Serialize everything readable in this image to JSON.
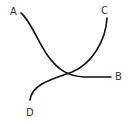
{
  "diagram": {
    "labels": {
      "a": "A",
      "b": "B",
      "c": "C",
      "d": "D"
    },
    "curves": [
      {
        "from": "A",
        "to": "B"
      },
      {
        "from": "C",
        "to": "D"
      }
    ],
    "colors": {
      "stroke": "#111111",
      "label": "#333333",
      "background": "#ffffff"
    }
  }
}
